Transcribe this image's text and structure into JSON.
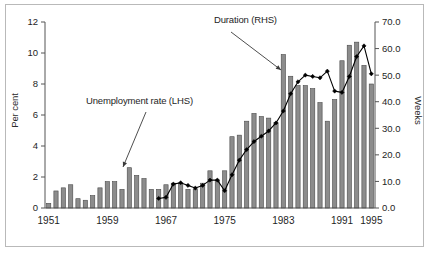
{
  "figure": {
    "background": "#ffffff",
    "border_color": "#b9b9b9"
  },
  "annotations": {
    "series_bar_label": "Unemployment rate (LHS)",
    "series_line_label": "Duration (RHS)"
  },
  "chart_data": {
    "type": "bar",
    "title": "",
    "xlabel": "",
    "ylabel": "Per cent",
    "y2label": "Weeks",
    "ylim": [
      0,
      12
    ],
    "y2lim": [
      0,
      70
    ],
    "yticks": [
      "0",
      "2",
      "4",
      "6",
      "8",
      "10",
      "12"
    ],
    "ytick_values": [
      0,
      2,
      4,
      6,
      8,
      10,
      12
    ],
    "y2ticks": [
      "0.0",
      "10.0",
      "20.0",
      "30.0",
      "40.0",
      "50.0",
      "60.0",
      "70.0"
    ],
    "y2tick_values": [
      0,
      10,
      20,
      30,
      40,
      50,
      60,
      70
    ],
    "xticks": [
      "1951",
      "1959",
      "1967",
      "1975",
      "1983",
      "1991",
      "1995"
    ],
    "xtick_values": [
      1951,
      1959,
      1967,
      1975,
      1983,
      1991,
      1995
    ],
    "grid": false,
    "legend": "annotations-with-arrows",
    "bar_color": "#8c8c8c",
    "bar_edge_color": "#4a4a4a",
    "line_color": "#000000",
    "marker": "diamond",
    "categories": [
      1951,
      1952,
      1953,
      1954,
      1955,
      1956,
      1957,
      1958,
      1959,
      1960,
      1961,
      1962,
      1963,
      1964,
      1965,
      1966,
      1967,
      1968,
      1969,
      1970,
      1971,
      1972,
      1973,
      1974,
      1975,
      1976,
      1977,
      1978,
      1979,
      1980,
      1981,
      1982,
      1983,
      1984,
      1985,
      1986,
      1987,
      1988,
      1989,
      1990,
      1991,
      1992,
      1993,
      1994,
      1995
    ],
    "series": [
      {
        "name": "Unemployment rate (LHS)",
        "axis": "left",
        "unit": "per cent",
        "type": "bar",
        "values": [
          0.3,
          1.1,
          1.3,
          1.5,
          0.6,
          0.5,
          0.8,
          1.3,
          1.7,
          1.7,
          1.2,
          2.6,
          2.1,
          1.9,
          1.2,
          1.2,
          1.5,
          1.6,
          1.6,
          1.2,
          1.2,
          1.6,
          2.4,
          1.8,
          2.4,
          4.6,
          4.7,
          5.6,
          6.1,
          5.9,
          5.8,
          5.5,
          9.9,
          8.5,
          7.9,
          7.9,
          7.7,
          6.8,
          5.6,
          7.0,
          9.5,
          10.5,
          10.7,
          9.2,
          8.0
        ]
      },
      {
        "name": "Duration (RHS)",
        "axis": "right",
        "unit": "weeks",
        "type": "line",
        "start_year": 1966,
        "values": [
          null,
          null,
          null,
          null,
          null,
          null,
          null,
          null,
          null,
          null,
          null,
          null,
          null,
          null,
          null,
          3.6,
          4.0,
          9.0,
          9.5,
          8.5,
          7.5,
          8.5,
          10.5,
          10.5,
          6.5,
          12.5,
          18.0,
          22.0,
          25.0,
          27.0,
          29.0,
          32.0,
          36.5,
          43.0,
          47.5,
          50.0,
          49.5,
          49.0,
          51.5,
          44.0,
          43.5,
          49.5,
          57.0,
          61.0,
          50.5
        ]
      }
    ]
  }
}
